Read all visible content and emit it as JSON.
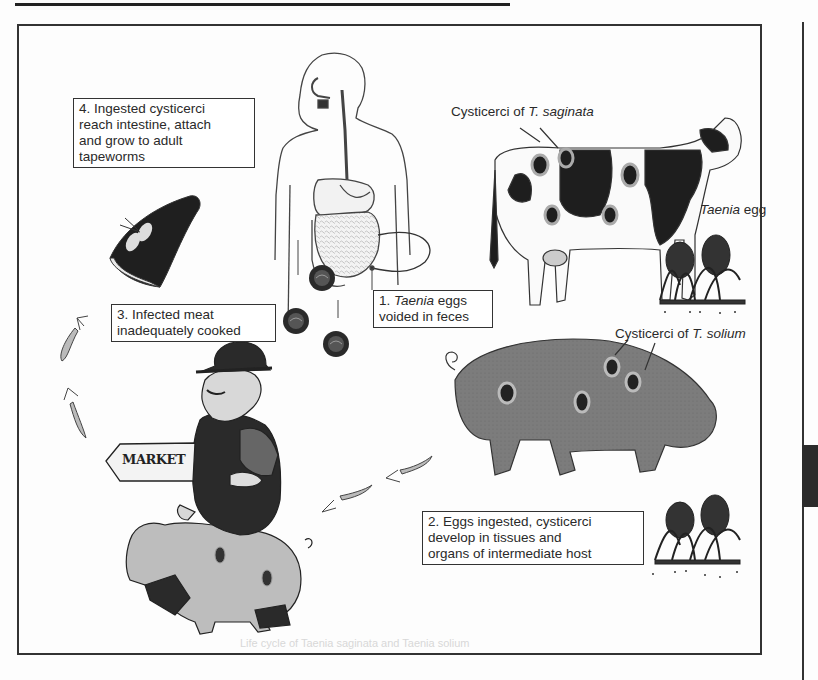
{
  "figure": {
    "type": "life-cycle diagram"
  },
  "labels": {
    "step1": {
      "number": "1.",
      "italic": "Taenia",
      "rest_line1": " eggs",
      "line2": "voided in feces"
    },
    "step2": {
      "line1": "2. Eggs ingested, cysticerci",
      "line2": "develop in tissues and",
      "line3": "organs of intermediate host"
    },
    "step3": {
      "line1": "3. Infected meat",
      "line2": "inadequately cooked"
    },
    "step4": {
      "line1": "4. Ingested cysticerci",
      "line2": "reach intestine, attach",
      "line3": "and grow to adult",
      "line4": "tapeworms"
    },
    "cow_cysticerci": {
      "prefix": "Cysticerci of ",
      "species": "T. saginata"
    },
    "pig_cysticerci": {
      "prefix": "Cysticerci of ",
      "species": "T. solium"
    },
    "taenia_egg": {
      "italic": "Taenia",
      "rest": " egg"
    },
    "market_sign": "MARKET"
  },
  "illustrations": {
    "human": "human-digestive-tract",
    "cow": "holstein-cow-intermediate-host",
    "pig": "pig-intermediate-host",
    "farmer": "farmer-riding-pig",
    "meat": "infected-meat-cut",
    "grass": [
      "grass-with-eggs-cow",
      "grass-with-eggs-pig"
    ],
    "eggs": 3,
    "arrows": [
      "arrow-pig-to-farmer-1",
      "arrow-pig-to-farmer-2",
      "arrow-up-1",
      "arrow-up-2"
    ]
  },
  "colors": {
    "line": "#333333",
    "cow_black": "#1e1e1e",
    "pig_gray": "#7a7a7a",
    "farmer_pig": "#bdbdbd",
    "side_tab": "#2b2b2b"
  },
  "footer": {
    "faded_caption": "Life cycle of Taenia saginata and Taenia solium"
  }
}
